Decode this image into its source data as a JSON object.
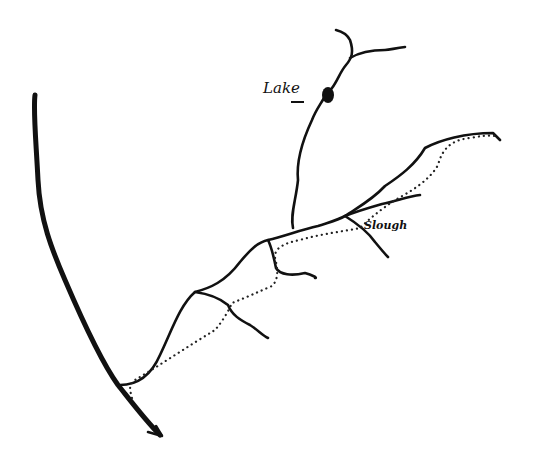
{
  "figure": {
    "type": "hand-drawn river sketch map",
    "labels": {
      "lake": "Lake",
      "slough": "Slough"
    },
    "caption": "",
    "legend": {
      "solid_line": "river / stream",
      "dotted_line": "trail / route",
      "filled_blob": "lake"
    },
    "colors": {
      "ink": "#111111",
      "background": "#ffffff"
    }
  }
}
